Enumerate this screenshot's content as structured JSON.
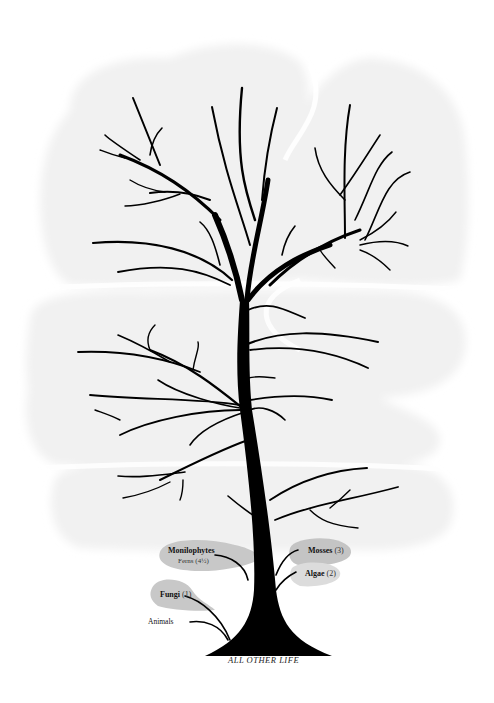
{
  "diagram": {
    "type": "tree-of-life",
    "colors": {
      "background": "#ffffff",
      "cloud": "#f1f1f1",
      "cloud_edge": "#f6f6f6",
      "tree": "#000000",
      "bubble_dark": "#c4c4c4",
      "bubble_light": "#dadada"
    },
    "root_label": "ALL OTHER LIFE",
    "leaves": [
      {
        "name": "Monilophytes",
        "count": "",
        "sub": "Ferns (4½)"
      },
      {
        "name": "Mosses",
        "count": "(3)"
      },
      {
        "name": "Algae",
        "count": "(2)"
      },
      {
        "name": "Fungi",
        "count": "(1)"
      },
      {
        "name": "Animals",
        "count": ""
      }
    ]
  }
}
